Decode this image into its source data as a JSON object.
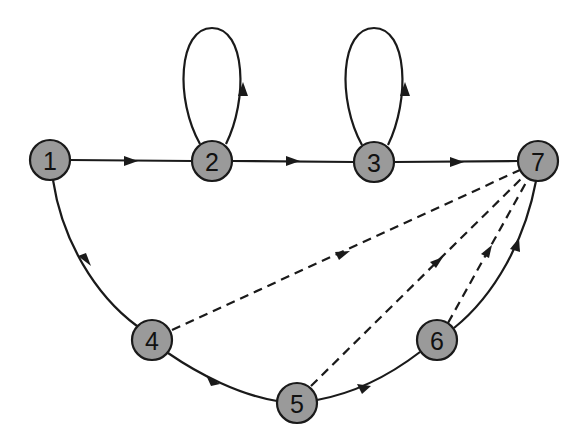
{
  "diagram": {
    "type": "directed-graph",
    "node_fill": "#9a9a9a",
    "stroke_color": "#1a1a1a",
    "nodes": [
      {
        "id": "1",
        "label": "1",
        "x": 50,
        "y": 160
      },
      {
        "id": "2",
        "label": "2",
        "x": 212,
        "y": 161
      },
      {
        "id": "3",
        "label": "3",
        "x": 374,
        "y": 162
      },
      {
        "id": "7",
        "label": "7",
        "x": 538,
        "y": 161
      },
      {
        "id": "4",
        "label": "4",
        "x": 152,
        "y": 340
      },
      {
        "id": "5",
        "label": "5",
        "x": 297,
        "y": 403
      },
      {
        "id": "6",
        "label": "6",
        "x": 437,
        "y": 340
      }
    ],
    "edges": [
      {
        "from": "1",
        "to": "2",
        "style": "solid"
      },
      {
        "from": "2",
        "to": "3",
        "style": "solid"
      },
      {
        "from": "3",
        "to": "7",
        "style": "solid"
      },
      {
        "from": "2",
        "to": "2",
        "style": "solid",
        "kind": "self-loop"
      },
      {
        "from": "3",
        "to": "3",
        "style": "solid",
        "kind": "self-loop"
      },
      {
        "from": "1",
        "to": "4",
        "style": "solid"
      },
      {
        "from": "4",
        "to": "5",
        "style": "solid"
      },
      {
        "from": "5",
        "to": "6",
        "style": "solid"
      },
      {
        "from": "6",
        "to": "7",
        "style": "solid"
      },
      {
        "from": "4",
        "to": "7",
        "style": "dashed"
      },
      {
        "from": "5",
        "to": "7",
        "style": "dashed"
      },
      {
        "from": "6",
        "to": "7",
        "style": "dashed"
      }
    ]
  }
}
